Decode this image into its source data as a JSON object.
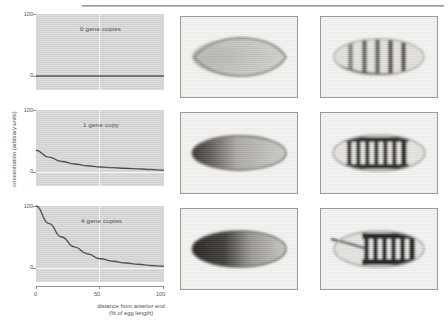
{
  "figure": {
    "x_axis_title_line1": "distance from anterior end",
    "x_axis_title_line2": "(% of egg length)",
    "y_axis_title": "concentration (arbitrary units)"
  },
  "chart_data": [
    {
      "type": "line",
      "title": "0 gene copies",
      "xlabel": "distance from anterior end (% of egg length)",
      "ylabel": "concentration (arbitrary units)",
      "xlim": [
        0,
        100
      ],
      "ylim": [
        0,
        100
      ],
      "xticks": [
        "0",
        "50",
        "100"
      ],
      "yticks": [
        "0",
        "100"
      ],
      "grid": true,
      "x": [
        0,
        10,
        20,
        30,
        40,
        50,
        60,
        70,
        80,
        90,
        100
      ],
      "values": [
        0,
        0,
        0,
        0,
        0,
        0,
        0,
        0,
        0,
        0,
        0
      ]
    },
    {
      "type": "line",
      "title": "1 gene copy",
      "xlabel": "distance from anterior end (% of egg length)",
      "ylabel": "concentration (arbitrary units)",
      "xlim": [
        0,
        100
      ],
      "ylim": [
        0,
        100
      ],
      "xticks": [
        "0",
        "50",
        "100"
      ],
      "yticks": [
        "0",
        "100"
      ],
      "grid": true,
      "x": [
        0,
        10,
        20,
        30,
        40,
        50,
        60,
        70,
        80,
        90,
        100
      ],
      "values": [
        35,
        24,
        17,
        13,
        10,
        8,
        7,
        6,
        5,
        4,
        3
      ]
    },
    {
      "type": "line",
      "title": "4 gene copies",
      "xlabel": "distance from anterior end (% of egg length)",
      "ylabel": "concentration (arbitrary units)",
      "xlim": [
        0,
        100
      ],
      "ylim": [
        0,
        100
      ],
      "xticks": [
        "0",
        "50",
        "100"
      ],
      "yticks": [
        "0",
        "100"
      ],
      "grid": true,
      "x": [
        0,
        10,
        20,
        30,
        40,
        50,
        60,
        70,
        80,
        90,
        100
      ],
      "values": [
        100,
        72,
        50,
        34,
        23,
        15,
        11,
        8,
        6,
        4,
        3
      ]
    }
  ],
  "ticks": {
    "y_top": "100",
    "y_zero": "0",
    "x_zero": "0",
    "x_mid": "50",
    "x_max": "100"
  },
  "panels": [
    {
      "label": "0 gene copies",
      "middle_image": "embryo-gradient-none",
      "right_image": "embryo-stripes-weak"
    },
    {
      "label": "1 gene copy",
      "middle_image": "embryo-gradient-anterior",
      "right_image": "embryo-stripes-seven"
    },
    {
      "label": "4 gene copies",
      "middle_image": "embryo-gradient-extended",
      "right_image": "embryo-stripes-shifted"
    }
  ],
  "colors": {
    "plot_background": "#d8d8d6",
    "curve": "#4a4a4a",
    "gridline": "#ffffff",
    "photo_background": "#f2f1ee",
    "stain": "#3b3b3b"
  }
}
